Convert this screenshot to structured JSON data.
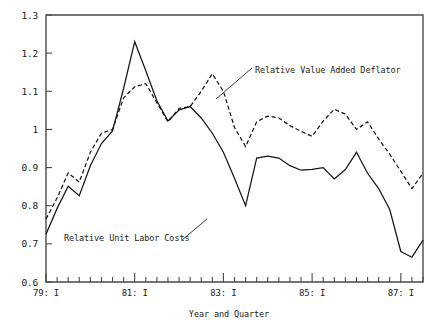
{
  "chart_data": {
    "type": "line",
    "title": "",
    "xlabel": "Year and Quarter",
    "ylabel": "",
    "ylim": [
      0.6,
      1.3
    ],
    "ytick_labels": [
      "1.3",
      "1.2",
      "1.1",
      "1",
      "0.9",
      "0.8",
      "0.7",
      "0.6"
    ],
    "ytick_values": [
      1.3,
      1.2,
      1.1,
      1.0,
      0.9,
      0.8,
      0.7,
      0.6
    ],
    "xtick_labels": [
      "79: I",
      "81: I",
      "83: I",
      "85: I",
      "87: I"
    ],
    "xtick_values": [
      0,
      8,
      16,
      24,
      32
    ],
    "xlim": [
      0,
      34
    ],
    "minor_ticks_per_major": 4,
    "grid": false,
    "legend_position": "inline-annotations",
    "x": [
      0,
      1,
      2,
      3,
      4,
      5,
      6,
      7,
      8,
      9,
      10,
      11,
      12,
      13,
      14,
      15,
      16,
      17,
      18,
      19,
      20,
      21,
      22,
      23,
      24,
      25,
      26,
      27,
      28,
      29,
      30,
      31,
      32,
      33,
      34
    ],
    "series": [
      {
        "name": "Relative Unit Labor Costs",
        "style": "solid",
        "values": [
          0.725,
          0.793,
          0.851,
          0.826,
          0.905,
          0.963,
          0.996,
          1.108,
          1.23,
          1.154,
          1.075,
          1.022,
          1.051,
          1.06,
          1.03,
          0.99,
          0.94,
          0.872,
          0.8,
          0.925,
          0.93,
          0.925,
          0.905,
          0.893,
          0.895,
          0.9,
          0.87,
          0.895,
          0.94,
          0.885,
          0.845,
          0.79,
          0.68,
          0.665,
          0.71
        ]
      },
      {
        "name": "Relative Value Added Deflator",
        "style": "dashed",
        "values": [
          0.765,
          0.82,
          0.886,
          0.862,
          0.94,
          0.99,
          1.0,
          1.083,
          1.112,
          1.12,
          1.07,
          1.02,
          1.055,
          1.06,
          1.1,
          1.146,
          1.1,
          1.005,
          0.955,
          1.02,
          1.035,
          1.03,
          1.01,
          0.995,
          0.982,
          1.022,
          1.053,
          1.04,
          1.0,
          1.02,
          0.975,
          0.935,
          0.89,
          0.845,
          0.885
        ]
      }
    ],
    "annotations": [
      {
        "text": "Relative Value Added Deflator",
        "series": "Relative Value Added Deflator",
        "label_x": 255,
        "label_y": 73,
        "leader_from_x": 216,
        "leader_from_y": 99,
        "leader_to_x": 252,
        "leader_to_y": 68
      },
      {
        "text": "Relative Unit Labor Costs",
        "series": "Relative Unit Labor Costs",
        "label_x": 64,
        "label_y": 241,
        "leader_from_x": 182,
        "leader_from_y": 240,
        "leader_to_x": 207,
        "leader_to_y": 219
      }
    ],
    "colors": {
      "line": "#161616",
      "axis": "#4a4a4a",
      "text": "#1a1a1a",
      "background": "#ffffff"
    }
  }
}
